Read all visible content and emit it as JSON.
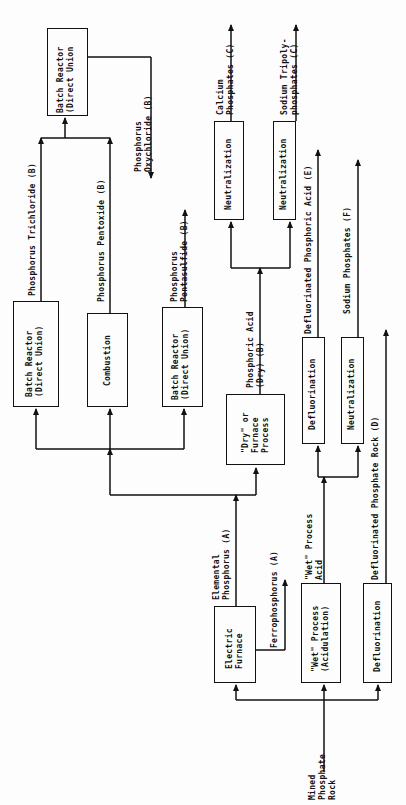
{
  "diagram": {
    "type": "process-flow",
    "orientation": "rotated-90-ccw",
    "input": {
      "line1": "Mined",
      "line2": "Phosphate",
      "line3": "Rock"
    },
    "processes": {
      "electric_furnace": {
        "line1": "Electric",
        "line2": "Furnace"
      },
      "wet_process": {
        "line1": "\"Wet\" Process",
        "line2": "(Acidulation)"
      },
      "defluorination_rock": {
        "line1": "Defluorination"
      },
      "dry_process": {
        "line1": "\"Dry\" or",
        "line2": "Furnace",
        "line3": "Process"
      },
      "batch_reactor_trichloride": {
        "line1": "Batch Reactor",
        "line2": "(Direct Union)"
      },
      "combustion": {
        "line1": "Combustion"
      },
      "batch_reactor_pentasulfide": {
        "line1": "Batch Reactor",
        "line2": "(Direct Union)"
      },
      "batch_reactor_oxychloride": {
        "line1": "Batch Reactor",
        "line2": "(Direct Union"
      },
      "neutralization_calcium": {
        "line1": "Neutralization"
      },
      "neutralization_sodium_tripoly": {
        "line1": "Neutralization"
      },
      "defluorination_acid": {
        "line1": "Defluorination"
      },
      "neutralization_sodium": {
        "line1": "Neutralization"
      }
    },
    "products": {
      "elemental_phosphorus": {
        "line1": "Elemental",
        "line2": "Phosphorus (A)"
      },
      "ferrophosphorus": {
        "line1": "Ferrophosphorus (A)"
      },
      "wet_process_acid": {
        "line1": "\"Wet\" Process",
        "line2": "Acid"
      },
      "defluorinated_rock": {
        "line1": "Defluorinated Phosphate Rock (D)"
      },
      "dry_phosphoric_acid": {
        "line1": "Phosphoric Acid",
        "line2": "(Dry)   (B)"
      },
      "phosphorus_trichloride": {
        "line1": "Phosphorus Trichloride (B)"
      },
      "phosphorus_pentoxide": {
        "line1": "Phosphorus Pentoxide (B)"
      },
      "phosphorus_pentasulfide": {
        "line1": "Phosphorus",
        "line2": "Pentasulfide (B)"
      },
      "phosphorus_oxychloride": {
        "line1": "Phosphorus",
        "line2": "Oxychloride (B)"
      },
      "calcium_phosphates": {
        "line1": "Calcium",
        "line2": "Phosphates (C)"
      },
      "sodium_tripolyphosphates": {
        "line1": "Sodium Tripoly-",
        "line2": "phosphates (C)"
      },
      "defluorinated_phosphoric_acid": {
        "line1": "Defluorinated Phosphoric Acid (E)"
      },
      "sodium_phosphates": {
        "line1": "Sodium Phosphates (F)"
      }
    },
    "colors": {
      "ink": "#111111",
      "paper": "#fdfdfd"
    }
  }
}
